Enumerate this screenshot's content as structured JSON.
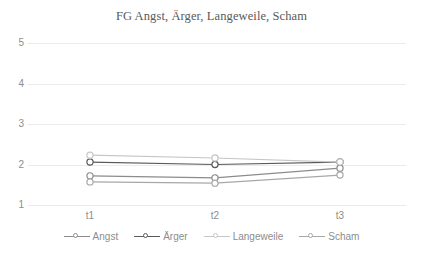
{
  "chart_data": {
    "type": "line",
    "title": "FG Angst, Ärger, Langeweile, Scham",
    "xlabel": "",
    "ylabel": "",
    "categories": [
      "t1",
      "t2",
      "t3"
    ],
    "ylim": [
      1,
      5
    ],
    "yticks": [
      1,
      2,
      3,
      4,
      5
    ],
    "ytick_labels": [
      "1",
      "2",
      "3",
      "4",
      "5"
    ],
    "grid": true,
    "legend_position": "bottom",
    "marker": "open-circle",
    "series": [
      {
        "name": "Angst",
        "values": [
          1.72,
          1.67,
          1.91
        ],
        "color": "#8c8c8c"
      },
      {
        "name": "Ärger",
        "values": [
          2.06,
          2.0,
          2.06
        ],
        "color": "#5a5a5a"
      },
      {
        "name": "Langeweile",
        "values": [
          2.23,
          2.16,
          2.06
        ],
        "color": "#c6c6c6"
      },
      {
        "name": "Scham",
        "values": [
          1.57,
          1.54,
          1.74
        ],
        "color": "#a8a8a8"
      }
    ]
  },
  "legend": {
    "items": [
      {
        "label": "Angst"
      },
      {
        "label": "Ärger"
      },
      {
        "label": "Langeweile"
      },
      {
        "label": "Scham"
      }
    ]
  },
  "axis": {
    "y_labels": [
      "5",
      "4",
      "3",
      "2",
      "1"
    ],
    "x_labels": [
      "t1",
      "t2",
      "t3"
    ]
  }
}
